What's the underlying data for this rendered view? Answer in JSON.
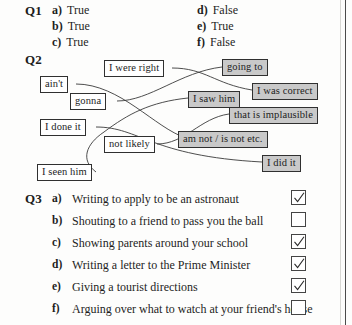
{
  "questions": {
    "q1": {
      "label": "Q1",
      "left_column": [
        {
          "letter": "a)",
          "text": "True"
        },
        {
          "letter": "b)",
          "text": "True"
        },
        {
          "letter": "c)",
          "text": "True"
        }
      ],
      "right_column": [
        {
          "letter": "d)",
          "text": "False"
        },
        {
          "letter": "e)",
          "text": "True"
        },
        {
          "letter": "f)",
          "text": "False"
        }
      ]
    },
    "q2": {
      "label": "Q2",
      "left_nodes": [
        {
          "id": "i-were-right",
          "text": "I were right"
        },
        {
          "id": "aint",
          "text": "ain't"
        },
        {
          "id": "gonna",
          "text": "gonna"
        },
        {
          "id": "i-done-it",
          "text": "I done it"
        },
        {
          "id": "not-likely",
          "text": "not likely"
        },
        {
          "id": "i-seen-him",
          "text": "I seen him"
        }
      ],
      "right_nodes": [
        {
          "id": "going-to",
          "text": "going to"
        },
        {
          "id": "i-was-correct",
          "text": "I was correct"
        },
        {
          "id": "i-saw-him",
          "text": "I saw him"
        },
        {
          "id": "that-is-implausible",
          "text": "that is implausible"
        },
        {
          "id": "am-not-is-not",
          "text": "am not / is not etc."
        },
        {
          "id": "i-did-it",
          "text": "I did it"
        }
      ],
      "matches": [
        {
          "from": "i-were-right",
          "to": "i-was-correct"
        },
        {
          "from": "aint",
          "to": "am-not-is-not"
        },
        {
          "from": "gonna",
          "to": "going-to"
        },
        {
          "from": "i-done-it",
          "to": "i-did-it"
        },
        {
          "from": "not-likely",
          "to": "that-is-implausible"
        },
        {
          "from": "i-seen-him",
          "to": "i-saw-him"
        }
      ]
    },
    "q3": {
      "label": "Q3",
      "rows": [
        {
          "letter": "a)",
          "text": "Writing to apply to be an astronaut",
          "checked": true
        },
        {
          "letter": "b)",
          "text": "Shouting to a friend to pass you the ball",
          "checked": false
        },
        {
          "letter": "c)",
          "text": "Showing parents around your school",
          "checked": true
        },
        {
          "letter": "d)",
          "text": "Writing a letter to the Prime Minister",
          "checked": true
        },
        {
          "letter": "e)",
          "text": "Giving a tourist directions",
          "checked": true
        },
        {
          "letter": "f)",
          "text": "Arguing over what to watch at your friend's house",
          "checked": false
        }
      ]
    }
  },
  "colors": {
    "ink": "#1d1d1d",
    "box_fill_grey": "#c9c9c9",
    "box_fill_white": "#ffffff",
    "box_border": "#303030",
    "page_background": "#fdfdfc"
  }
}
